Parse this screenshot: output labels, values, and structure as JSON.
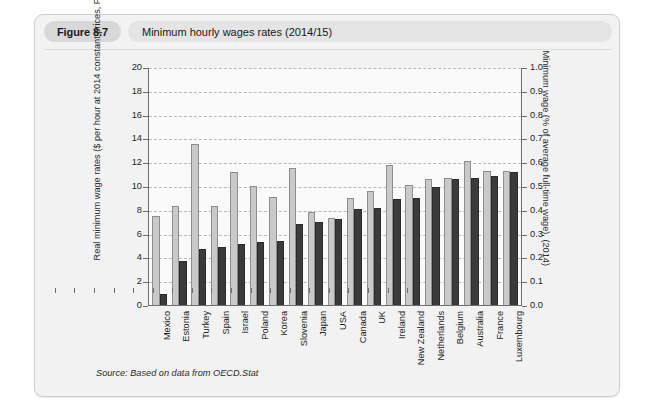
{
  "figure": {
    "tag": "Figure 8.7",
    "title": "Minimum hourly wages rates (2014/15)",
    "source_prefix": "Source:",
    "source_text": "Based on data from",
    "source_ref": "OECD.Stat"
  },
  "chart_data": {
    "type": "bar",
    "title": "Minimum hourly wages rates (2014/15)",
    "xlabel": "",
    "ylabel": "Real minimum wage rates ($ per hour at 2014 constant prices, PPP) (2015)",
    "ylabel_right": "Minimum wage (% of average full-time wage), (2014)",
    "ylim": [
      0,
      20
    ],
    "yticks": [
      "0",
      "2",
      "4",
      "6",
      "8",
      "10",
      "12",
      "14",
      "16",
      "18",
      "20"
    ],
    "ylim_right": [
      0,
      1
    ],
    "yticks_right": [
      "0.0",
      "0.1",
      "0.2",
      "0.3",
      "0.4",
      "0.5",
      "0.6",
      "0.7",
      "0.8",
      "0.9",
      "1.0"
    ],
    "grid": true,
    "legend_position": "none",
    "categories": [
      "Mexico",
      "Estonia",
      "Turkey",
      "Spain",
      "Israel",
      "Poland",
      "Korea",
      "Slovenia",
      "Japan",
      "USA",
      "Canada",
      "UK",
      "Ireland",
      "New Zealand",
      "Netherlands",
      "Belgium",
      "Australia",
      "France",
      "Luxembourg"
    ],
    "series": [
      {
        "name": "Real minimum wage rates ($ per hour at 2014 constant prices, PPP) (2015)",
        "axis": "left",
        "color": "#c9c9c9",
        "values": [
          7.5,
          8.3,
          13.5,
          8.3,
          11.2,
          10.0,
          9.1,
          11.5,
          7.8,
          7.35,
          9.0,
          9.6,
          11.8,
          10.1,
          10.6,
          10.7,
          12.1,
          11.3,
          11.3
        ]
      },
      {
        "name": "Minimum wage (% of average full-time wage), (2014)",
        "axis": "right",
        "color": "#3b3b3b",
        "values_pct": [
          0.045,
          0.185,
          0.235,
          0.245,
          0.255,
          0.265,
          0.27,
          0.34,
          0.35,
          0.36,
          0.405,
          0.408,
          0.445,
          0.45,
          0.495,
          0.53,
          0.535,
          0.54,
          0.56
        ],
        "values_scaled": [
          0.9,
          3.7,
          4.7,
          4.9,
          5.1,
          5.3,
          5.4,
          6.8,
          7.0,
          7.2,
          8.1,
          8.15,
          8.9,
          9.0,
          9.9,
          10.6,
          10.7,
          10.8,
          11.2
        ]
      }
    ]
  }
}
